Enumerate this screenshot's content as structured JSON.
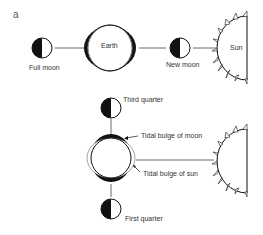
{
  "panel_label": "a",
  "top": {
    "full_moon": "Full moon",
    "earth": "Earth",
    "new_moon": "New moon",
    "sun": "Sun"
  },
  "bottom": {
    "third_quarter": "Third quarter",
    "tidal_bulge_moon": "Tidal bulge of moon",
    "tidal_bulge_sun": "Tidal bulge of sun",
    "first_quarter": "First quarter"
  }
}
